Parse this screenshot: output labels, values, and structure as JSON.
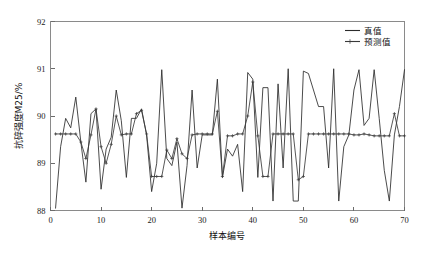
{
  "chart_data": {
    "type": "line",
    "title": "",
    "xlabel": "样本编号",
    "ylabel": "抗碎强度M25/%",
    "xlim": [
      0,
      70
    ],
    "ylim": [
      88,
      92
    ],
    "xticks": [
      0,
      10,
      20,
      30,
      40,
      50,
      60,
      70
    ],
    "yticks": [
      88,
      89,
      90,
      91,
      92
    ],
    "grid": false,
    "legend_position": "upper right",
    "x": [
      1,
      2,
      3,
      4,
      5,
      6,
      7,
      8,
      9,
      10,
      11,
      12,
      13,
      14,
      15,
      16,
      17,
      18,
      19,
      20,
      21,
      22,
      23,
      24,
      25,
      26,
      27,
      28,
      29,
      30,
      31,
      32,
      33,
      34,
      35,
      36,
      37,
      38,
      39,
      40,
      41,
      42,
      43,
      44,
      45,
      46,
      47,
      48,
      49,
      50,
      51,
      52,
      53,
      54,
      55,
      56,
      57,
      58,
      59,
      60,
      61,
      62,
      63,
      64,
      65,
      66,
      67,
      68,
      69,
      70
    ],
    "series": [
      {
        "name": "真值",
        "marker": "none",
        "color": "#2b2b2b",
        "values": [
          88.05,
          89.35,
          89.95,
          89.75,
          90.4,
          89.45,
          88.6,
          90.05,
          90.15,
          88.45,
          89.3,
          89.55,
          90.55,
          89.9,
          88.7,
          89.95,
          89.95,
          90.15,
          89.6,
          88.4,
          89.0,
          90.98,
          89.1,
          88.95,
          89.45,
          88.05,
          88.95,
          90.55,
          88.9,
          89.6,
          89.6,
          89.6,
          90.78,
          88.7,
          89.3,
          89.15,
          89.4,
          88.4,
          90.92,
          90.78,
          88.7,
          90.6,
          90.6,
          88.2,
          90.68,
          88.9,
          91.0,
          88.2,
          88.2,
          90.95,
          90.9,
          90.55,
          90.2,
          90.2,
          88.9,
          91.0,
          88.2,
          89.35,
          89.6,
          90.55,
          90.98,
          89.8,
          89.95,
          90.98,
          89.95,
          88.85,
          88.2,
          89.6,
          90.2,
          90.98
        ]
      },
      {
        "name": "预测值",
        "marker": "plus",
        "color": "#3a3a3a",
        "values": [
          89.62,
          89.62,
          89.62,
          89.62,
          89.62,
          89.45,
          89.1,
          89.6,
          90.15,
          89.35,
          89.0,
          89.4,
          90.0,
          89.6,
          89.62,
          89.62,
          90.05,
          90.12,
          89.62,
          88.72,
          88.72,
          88.72,
          89.28,
          89.1,
          89.52,
          89.2,
          89.1,
          89.6,
          89.62,
          89.62,
          89.62,
          89.62,
          90.1,
          88.72,
          89.58,
          89.58,
          89.62,
          89.62,
          90.0,
          90.72,
          89.58,
          88.72,
          88.72,
          89.62,
          89.62,
          89.62,
          89.62,
          89.62,
          88.65,
          88.72,
          89.62,
          89.62,
          89.62,
          89.62,
          89.62,
          89.62,
          89.62,
          89.62,
          89.62,
          89.6,
          89.6,
          89.62,
          89.6,
          89.58,
          89.58,
          89.58,
          89.58,
          90.05,
          89.58,
          89.58
        ]
      }
    ]
  },
  "legend": {
    "items": [
      {
        "label": "真值"
      },
      {
        "label": "预测值"
      }
    ]
  },
  "axes": {
    "x_tick_labels": [
      "0",
      "10",
      "20",
      "30",
      "40",
      "50",
      "60",
      "70"
    ],
    "y_tick_labels": [
      "88",
      "89",
      "90",
      "91",
      "92"
    ],
    "x_axis_title": "样本编号",
    "y_axis_title": "抗碎强度M25/%"
  }
}
